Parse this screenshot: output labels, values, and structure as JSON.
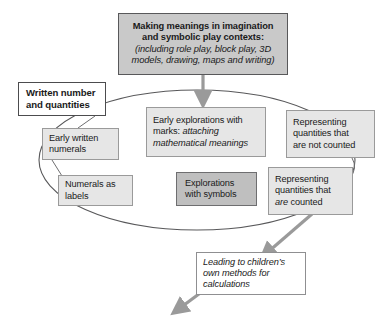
{
  "diagram": {
    "type": "flow-cycle-diagram",
    "nodes": {
      "making_meanings": {
        "line1": "Making meanings in imagination",
        "line2": "and symbolic play contexts:",
        "line3": "(including role play, block play, 3D",
        "line4": "models, drawing, maps and writing)"
      },
      "written_number": {
        "line1": "Written number",
        "line2": "and quantities"
      },
      "early_written_numerals": {
        "line1": "Early written",
        "line2": "numerals"
      },
      "numerals_as_labels": {
        "line1": "Numerals as",
        "line2": "labels"
      },
      "early_explorations": {
        "line1": "Early explorations with",
        "line2_plain": "marks: ",
        "line2_ital": "attaching",
        "line3_ital": "mathematical meanings"
      },
      "explorations_symbols": {
        "line1": "Explorations",
        "line2": "with symbols"
      },
      "representing_not_counted": {
        "line1": "Representing",
        "line2": "quantities that",
        "line3": "are not counted"
      },
      "representing_are_counted": {
        "line1": "Representing",
        "line2": "quantities that",
        "line3_ital": "are",
        "line3_plain": " counted"
      },
      "leading_to_calculations": {
        "line1": "Leading to children’s",
        "line2": "own methods for",
        "line3": "calculations"
      }
    },
    "colors": {
      "title_fill": "#c9c9c9",
      "gray_fill": "#e6e6e6",
      "midgray_fill": "#bfbfbf",
      "white_fill": "#ffffff",
      "border_dark": "#4c4c4e",
      "border_light": "#8f8f91",
      "arrow_gray": "#9a9a9a",
      "ellipse_stroke": "#58585a",
      "text": "#1a1a1a"
    }
  }
}
